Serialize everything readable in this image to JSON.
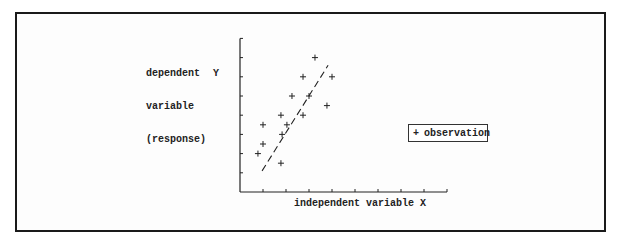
{
  "chart_data": {
    "type": "scatter",
    "title": "",
    "xlabel": "independent variable X",
    "ylabel": "dependent variable (response)  Y",
    "ylabel_lines": [
      "dependent",
      "variable",
      "(response)"
    ],
    "ylabel_symbol": "Y",
    "xlim": [
      0,
      9
    ],
    "ylim": [
      0,
      8
    ],
    "x_ticks": [
      1,
      2,
      3,
      4,
      5,
      6,
      7,
      8,
      9
    ],
    "y_ticks": [
      1,
      2,
      3,
      4,
      5,
      6,
      7,
      8
    ],
    "tick_labels_shown": false,
    "grid": false,
    "legend": {
      "position": "right",
      "entries": [
        {
          "marker": "+",
          "label": "observation"
        }
      ]
    },
    "series": [
      {
        "name": "observation",
        "marker": "+",
        "points": [
          {
            "x": 0.78,
            "y": 2.0
          },
          {
            "x": 1.0,
            "y": 2.5
          },
          {
            "x": 1.0,
            "y": 3.5
          },
          {
            "x": 1.78,
            "y": 1.5
          },
          {
            "x": 1.83,
            "y": 3.0
          },
          {
            "x": 2.04,
            "y": 3.5
          },
          {
            "x": 1.78,
            "y": 4.0
          },
          {
            "x": 2.26,
            "y": 5.0
          },
          {
            "x": 2.74,
            "y": 4.0
          },
          {
            "x": 3.0,
            "y": 5.0
          },
          {
            "x": 2.74,
            "y": 6.0
          },
          {
            "x": 3.78,
            "y": 4.5
          },
          {
            "x": 4.0,
            "y": 6.0
          },
          {
            "x": 3.26,
            "y": 7.0
          }
        ]
      }
    ],
    "fit_line": {
      "style": "dashed",
      "x0": 0.96,
      "y0": 1.1,
      "x1": 3.83,
      "y1": 6.6
    }
  },
  "labels": {
    "ylabel_line1": "dependent",
    "ylabel_line2": "variable",
    "ylabel_line3": "(response)",
    "ylabel_symbol": "Y",
    "xlabel": "independent variable X",
    "legend_marker": "+",
    "legend_label": "observation"
  },
  "colors": {
    "ink": "#222222",
    "frame": "#1a1a1a",
    "background": "#fdfdfd"
  }
}
